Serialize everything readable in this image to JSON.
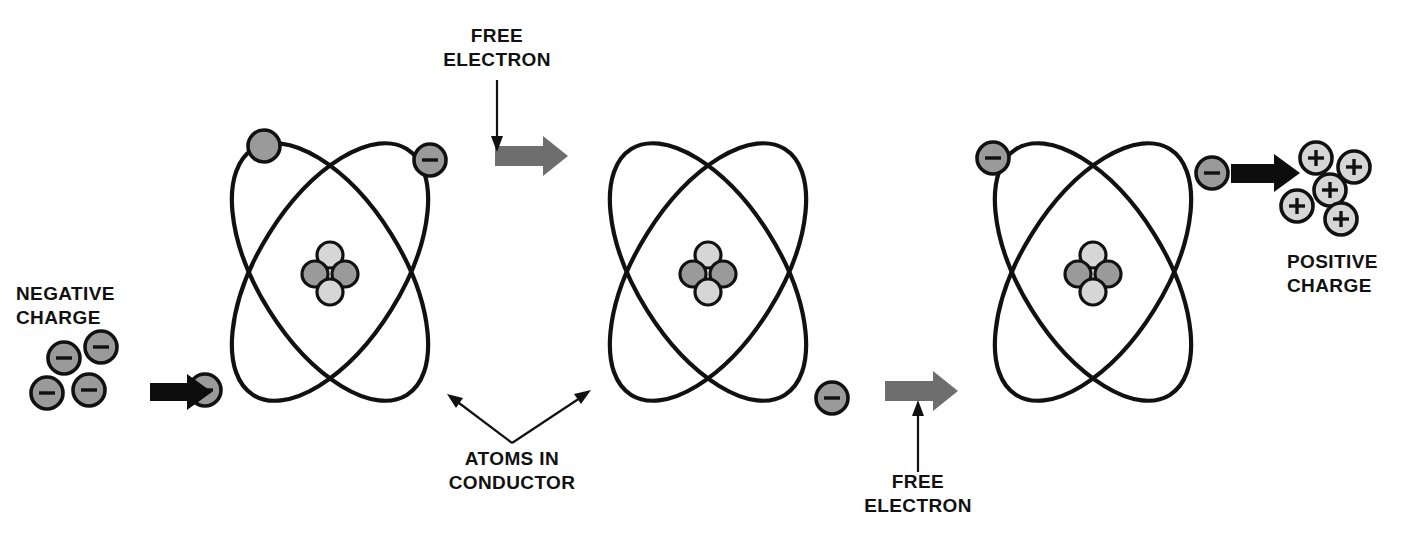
{
  "figure": {
    "background_color": "#ffffff",
    "width": 1411,
    "height": 539
  },
  "palette": {
    "outline": "#111111",
    "electron_fill": "#9a9a9a",
    "proton_fill": "#9a9a9a",
    "neutron_fill": "#d6d6d6",
    "positive_fill": "#d6d6d6",
    "gray_arrow": "#6e6e6e",
    "black_arrow": "#0d0d0d",
    "text": "#111111"
  },
  "labels": {
    "free_electron_top": {
      "line1": "FREE",
      "line2": "ELECTRON"
    },
    "free_electron_bottom": {
      "line1": "FREE",
      "line2": "ELECTRON"
    },
    "negative_charge": {
      "line1": "NEGATIVE",
      "line2": "CHARGE"
    },
    "positive_charge": {
      "line1": "POSITIVE",
      "line2": "CHARGE"
    },
    "atoms_in_conductor": {
      "line1": "ATOMS IN",
      "line2": "CONDUCTOR"
    }
  },
  "charge_clusters": {
    "negative": {
      "label": "NEGATIVE CHARGE",
      "sign": "minus",
      "count": 4,
      "particles": [
        {
          "cx": 47,
          "cy": 393,
          "r": 16
        },
        {
          "cx": 64,
          "cy": 358,
          "r": 16
        },
        {
          "cx": 101,
          "cy": 347,
          "r": 16
        },
        {
          "cx": 89,
          "cy": 390,
          "r": 16
        }
      ]
    },
    "positive": {
      "label": "POSITIVE CHARGE",
      "sign": "plus",
      "count": 5,
      "particles": [
        {
          "cx": 1316,
          "cy": 158,
          "r": 16
        },
        {
          "cx": 1354,
          "cy": 167,
          "r": 16
        },
        {
          "cx": 1330,
          "cy": 190,
          "r": 16
        },
        {
          "cx": 1297,
          "cy": 206,
          "r": 16
        },
        {
          "cx": 1341,
          "cy": 219,
          "r": 16
        }
      ]
    }
  },
  "atoms": [
    {
      "name": "atom-left",
      "cx": 330,
      "cy": 272,
      "orbit_rx": 72,
      "orbit_ry": 145,
      "orbit_rotations": [
        32,
        -32
      ],
      "nucleus": {
        "protons": 2,
        "neutrons": 2,
        "parts": [
          {
            "dx": 0,
            "dy": -17,
            "r": 13,
            "kind": "neutron"
          },
          {
            "dx": -15,
            "dy": 2,
            "r": 13,
            "kind": "proton"
          },
          {
            "dx": 15,
            "dy": 2,
            "r": 13,
            "kind": "proton"
          },
          {
            "dx": 0,
            "dy": 20,
            "r": 13,
            "kind": "neutron"
          }
        ]
      },
      "electrons": [
        {
          "cx": 264,
          "cy": 146,
          "r": 16,
          "sign": "none"
        },
        {
          "cx": 430,
          "cy": 160,
          "r": 16,
          "sign": "minus"
        },
        {
          "cx": 205,
          "cy": 390,
          "r": 16,
          "sign": "minus"
        }
      ]
    },
    {
      "name": "atom-middle",
      "cx": 708,
      "cy": 272,
      "orbit_rx": 72,
      "orbit_ry": 145,
      "orbit_rotations": [
        32,
        -32
      ],
      "nucleus": {
        "protons": 2,
        "neutrons": 2,
        "parts": [
          {
            "dx": 0,
            "dy": -17,
            "r": 13,
            "kind": "neutron"
          },
          {
            "dx": -15,
            "dy": 2,
            "r": 13,
            "kind": "proton"
          },
          {
            "dx": 15,
            "dy": 2,
            "r": 13,
            "kind": "proton"
          },
          {
            "dx": 0,
            "dy": 20,
            "r": 13,
            "kind": "neutron"
          }
        ]
      },
      "electrons": [
        {
          "cx": 832,
          "cy": 398,
          "r": 16,
          "sign": "minus"
        }
      ]
    },
    {
      "name": "atom-right",
      "cx": 1093,
      "cy": 272,
      "orbit_rx": 72,
      "orbit_ry": 145,
      "orbit_rotations": [
        32,
        -32
      ],
      "nucleus": {
        "protons": 2,
        "neutrons": 2,
        "parts": [
          {
            "dx": 0,
            "dy": -17,
            "r": 13,
            "kind": "neutron"
          },
          {
            "dx": -15,
            "dy": 2,
            "r": 13,
            "kind": "proton"
          },
          {
            "dx": 15,
            "dy": 2,
            "r": 13,
            "kind": "proton"
          },
          {
            "dx": 0,
            "dy": 20,
            "r": 13,
            "kind": "neutron"
          }
        ]
      },
      "electrons": [
        {
          "cx": 993,
          "cy": 158,
          "r": 16,
          "sign": "minus"
        },
        {
          "cx": 1212,
          "cy": 173,
          "r": 16,
          "sign": "minus"
        }
      ]
    }
  ],
  "arrows": [
    {
      "name": "gray-arrow-top",
      "color": "gray",
      "x": 495,
      "y": 155,
      "length": 65,
      "direction": "right"
    },
    {
      "name": "gray-arrow-bottom",
      "color": "gray",
      "x": 885,
      "y": 390,
      "length": 65,
      "direction": "right"
    },
    {
      "name": "black-arrow-left",
      "color": "black",
      "x": 150,
      "y": 390,
      "length": 58,
      "direction": "right"
    },
    {
      "name": "black-arrow-right",
      "color": "black",
      "x": 1231,
      "y": 173,
      "length": 62,
      "direction": "right"
    }
  ]
}
